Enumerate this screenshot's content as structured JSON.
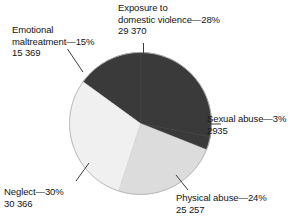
{
  "chart_data": {
    "type": "pie",
    "title": "",
    "subtitle": "",
    "xlabel": "",
    "ylabel": "",
    "legend_position": "callout-labels",
    "grid": false,
    "total": 103297,
    "categories": [
      "Exposure to domestic violence",
      "Sexual abuse",
      "Physical abuse",
      "Neglect",
      "Emotional maltreatment"
    ],
    "values": [
      29370,
      2935,
      25257,
      30366,
      15369
    ],
    "percentages": [
      28,
      3,
      24,
      30,
      15
    ],
    "slices": [
      {
        "name": "Exposure to domestic violence",
        "percent": 28,
        "percent_text": "28%",
        "count": 29370,
        "count_text": "29 370",
        "color": "#3a3a3a",
        "start_angle": 0,
        "end_angle": 100.8
      },
      {
        "name": "Sexual abuse",
        "percent": 3,
        "percent_text": "3%",
        "count": 2935,
        "count_text": "2935",
        "color": "#3a3a3a",
        "start_angle": 100.8,
        "end_angle": 111.6
      },
      {
        "name": "Physical abuse",
        "percent": 24,
        "percent_text": "24%",
        "count": 25257,
        "count_text": "25 257",
        "color": "#dcdcdc",
        "start_angle": 111.6,
        "end_angle": 198.0
      },
      {
        "name": "Neglect",
        "percent": 30,
        "percent_text": "30%",
        "count": 30366,
        "count_text": "30 366",
        "color": "#f0f0f0",
        "start_angle": 198.0,
        "end_angle": 306.0
      },
      {
        "name": "Emotional maltreatment",
        "percent": 15,
        "percent_text": "15%",
        "count": 15369,
        "count_text": "15 369",
        "color": "#3a3a3a",
        "start_angle": 306.0,
        "end_angle": 360.0
      }
    ]
  },
  "labels": {
    "exposure": {
      "line1": "Exposure to",
      "line2": "domestic violence—28%",
      "line3": "29 370"
    },
    "emotional": {
      "line1": "Emotional",
      "line2": "maltreatment—15%",
      "line3": "15 369"
    },
    "sexual": {
      "line1": "Sexual abuse—3%",
      "line2": "2935"
    },
    "physical": {
      "line1": "Physical abuse—24%",
      "line2": "25 257"
    },
    "neglect": {
      "line1": "Neglect—30%",
      "line2": "30 366"
    }
  },
  "colors": {
    "dark_slice": "#3a3a3a",
    "mid_slice": "#dcdcdc",
    "light_slice": "#f0f0f0",
    "outline": "#9a9a9a",
    "leader_line": "#3c3c3c",
    "text": "#141414",
    "background": "#ffffff"
  }
}
